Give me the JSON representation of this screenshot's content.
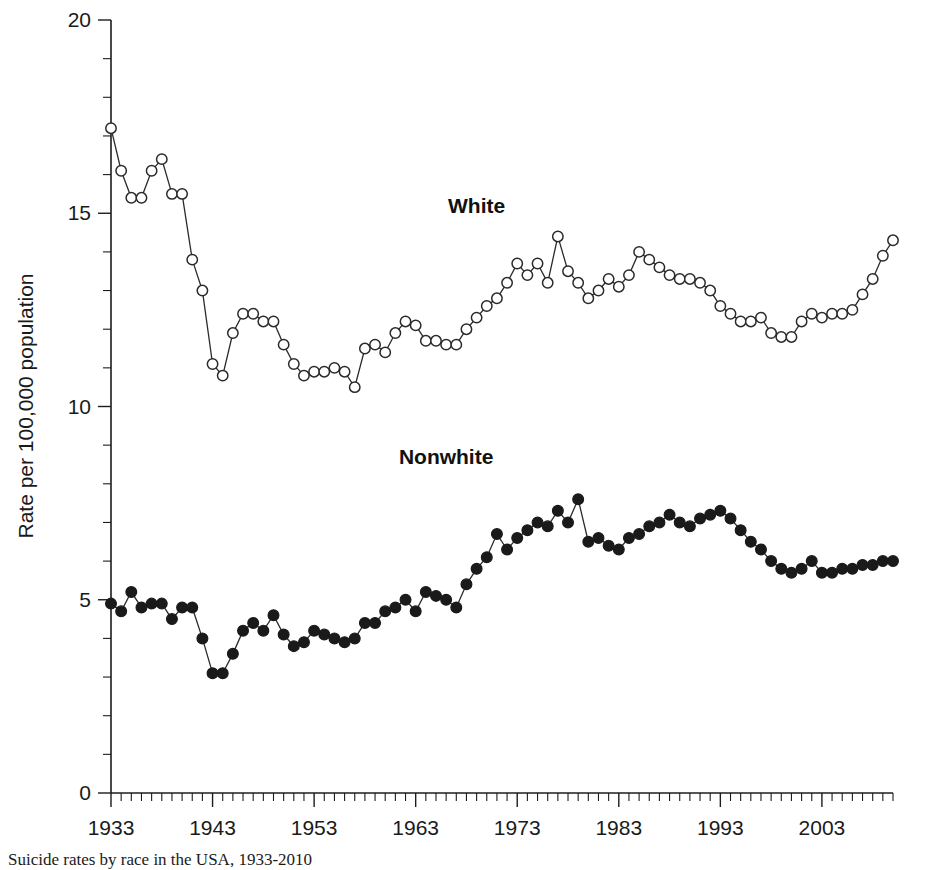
{
  "chart_data": {
    "type": "line",
    "title": "",
    "caption": "Suicide rates by race in the USA, 1933-2010",
    "xlabel": "",
    "ylabel": "Rate per 100,000 population",
    "ylim": [
      0,
      20
    ],
    "xlim": [
      1933,
      2010
    ],
    "yticks": [
      0,
      5,
      10,
      15,
      20
    ],
    "ytick_labels": [
      "0",
      "5",
      "10",
      "15",
      "20"
    ],
    "yminor_step": 1,
    "xticks": [
      1933,
      1943,
      1953,
      1963,
      1973,
      1983,
      1993,
      2003
    ],
    "xtick_labels": [
      "1933",
      "1943",
      "1953",
      "1963",
      "1973",
      "1983",
      "1993",
      "2003"
    ],
    "xminor_step": 1,
    "grid": false,
    "legend_position": "inline-annotation",
    "annotations": [
      {
        "text": "White",
        "x": 1969,
        "y": 15.0
      },
      {
        "text": "Nonwhite",
        "x": 1966,
        "y": 8.5
      }
    ],
    "x": [
      1933,
      1934,
      1935,
      1936,
      1937,
      1938,
      1939,
      1940,
      1941,
      1942,
      1943,
      1944,
      1945,
      1946,
      1947,
      1948,
      1949,
      1950,
      1951,
      1952,
      1953,
      1954,
      1955,
      1956,
      1957,
      1958,
      1959,
      1960,
      1961,
      1962,
      1963,
      1964,
      1965,
      1966,
      1967,
      1968,
      1969,
      1970,
      1971,
      1972,
      1973,
      1974,
      1975,
      1976,
      1977,
      1978,
      1979,
      1980,
      1981,
      1982,
      1983,
      1984,
      1985,
      1986,
      1987,
      1988,
      1989,
      1990,
      1991,
      1992,
      1993,
      1994,
      1995,
      1996,
      1997,
      1998,
      1999,
      2000,
      2001,
      2002,
      2003,
      2004,
      2005,
      2006,
      2007,
      2008,
      2009,
      2010
    ],
    "series": [
      {
        "name": "White",
        "marker": "open-circle",
        "color": "#2a2a2a",
        "values": [
          17.2,
          16.1,
          15.4,
          15.4,
          16.1,
          16.4,
          15.5,
          15.5,
          13.8,
          13.0,
          11.1,
          10.8,
          11.9,
          12.4,
          12.4,
          12.2,
          12.2,
          11.6,
          11.1,
          10.8,
          10.9,
          10.9,
          11.0,
          10.9,
          10.5,
          11.5,
          11.6,
          11.4,
          11.9,
          12.2,
          12.1,
          11.7,
          11.7,
          11.6,
          11.6,
          12.0,
          12.3,
          12.6,
          12.8,
          13.2,
          13.7,
          13.4,
          13.7,
          13.2,
          14.4,
          13.5,
          13.2,
          12.8,
          13.0,
          13.3,
          13.1,
          13.4,
          14.0,
          13.8,
          13.6,
          13.4,
          13.3,
          13.3,
          13.2,
          13.0,
          12.6,
          12.4,
          12.2,
          12.2,
          12.3,
          11.9,
          11.8,
          11.8,
          12.2,
          12.4,
          12.3,
          12.4,
          12.4,
          12.5,
          12.9,
          13.3,
          13.9,
          14.3
        ]
      },
      {
        "name": "Nonwhite",
        "marker": "filled-circle",
        "color": "#1a1a1a",
        "values": [
          4.9,
          4.7,
          5.2,
          4.8,
          4.9,
          4.9,
          4.5,
          4.8,
          4.8,
          4.0,
          3.1,
          3.1,
          3.6,
          4.2,
          4.4,
          4.2,
          4.6,
          4.1,
          3.8,
          3.9,
          4.2,
          4.1,
          4.0,
          3.9,
          4.0,
          4.4,
          4.4,
          4.7,
          4.8,
          5.0,
          4.7,
          5.2,
          5.1,
          5.0,
          4.8,
          5.4,
          5.8,
          6.1,
          6.7,
          6.3,
          6.6,
          6.8,
          7.0,
          6.9,
          7.3,
          7.0,
          7.6,
          6.5,
          6.6,
          6.4,
          6.3,
          6.6,
          6.7,
          6.9,
          7.0,
          7.2,
          7.0,
          6.9,
          7.1,
          7.2,
          7.3,
          7.1,
          6.8,
          6.5,
          6.3,
          6.0,
          5.8,
          5.7,
          5.8,
          6.0,
          5.7,
          5.7,
          5.8,
          5.8,
          5.9,
          5.9,
          6.0,
          6.0
        ]
      }
    ]
  },
  "plot_geometry": {
    "left": 111,
    "right": 893,
    "top": 20,
    "bottom": 793
  }
}
